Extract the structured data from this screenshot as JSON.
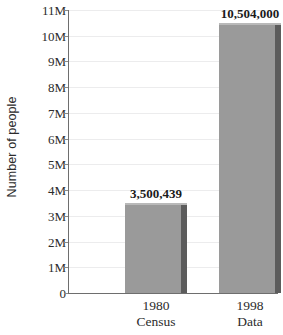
{
  "chart_data": {
    "type": "bar",
    "title": "",
    "xlabel": "",
    "ylabel": "Number of people",
    "categories": [
      "1980 Census",
      "1998 Data"
    ],
    "category_lines": [
      {
        "line1": "1980",
        "line2": "Census"
      },
      {
        "line1": "1998",
        "line2": "Data"
      }
    ],
    "values": [
      3500439,
      10504000
    ],
    "data_labels": [
      "3,500,439",
      "10,504,000"
    ],
    "ylim": [
      0,
      11000000
    ],
    "ytick_values": [
      0,
      1000000,
      2000000,
      3000000,
      4000000,
      5000000,
      6000000,
      7000000,
      8000000,
      9000000,
      10000000,
      11000000
    ],
    "ytick_labels": [
      "0",
      "1M",
      "2M",
      "3M",
      "4M",
      "5M",
      "6M",
      "7M",
      "8M",
      "9M",
      "10M",
      "11M"
    ],
    "grid": true,
    "legend": false,
    "legend_position": "none",
    "colors": {
      "bar_face": "#9a9a9a",
      "bar_side": "#5c5c5c",
      "bar_top": "#b9b9b9",
      "axis": "#6e6e6e",
      "gridline": "#ececed",
      "text": "#2b2b2b",
      "background": "#ffffff"
    }
  }
}
